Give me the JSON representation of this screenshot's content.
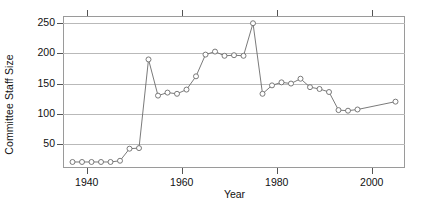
{
  "chart_data": {
    "type": "line",
    "title": "",
    "xlabel": "Year",
    "ylabel": "Committee Staff Size",
    "xlim": [
      1935,
      2007
    ],
    "ylim": [
      10,
      262
    ],
    "xticks": [
      1940,
      1960,
      1980,
      2000
    ],
    "yticks": [
      50,
      100,
      150,
      200,
      250
    ],
    "grid": true,
    "legend": null,
    "marker": "open-circle",
    "series": [
      {
        "name": "Committee Staff Size",
        "x": [
          1937,
          1939,
          1941,
          1943,
          1945,
          1947,
          1949,
          1951,
          1953,
          1955,
          1957,
          1959,
          1961,
          1963,
          1965,
          1967,
          1969,
          1971,
          1973,
          1975,
          1977,
          1979,
          1981,
          1983,
          1985,
          1987,
          1989,
          1991,
          1993,
          1995,
          1997,
          2005
        ],
        "values": [
          20,
          20,
          20,
          20,
          20,
          22,
          42,
          43,
          190,
          130,
          135,
          133,
          140,
          162,
          198,
          203,
          196,
          197,
          196,
          250,
          133,
          147,
          152,
          150,
          158,
          144,
          141,
          136,
          106,
          105,
          107,
          120
        ]
      }
    ]
  },
  "axis": {
    "ylabel_text": "Committee Staff Size",
    "xlabel_text": "Year",
    "ytick_labels": [
      "50",
      "100",
      "150",
      "200",
      "250"
    ],
    "xtick_labels": [
      "1940",
      "1960",
      "1980",
      "2000"
    ]
  },
  "colors": {
    "line": "#6b6b6b",
    "marker_fill": "#ffffff",
    "grid": "#b9b9b9",
    "axis": "#9a9a9a",
    "text": "#111111",
    "background": "#ffffff"
  }
}
